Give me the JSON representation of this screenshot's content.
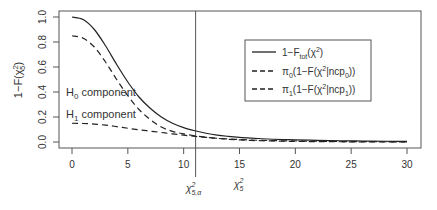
{
  "chart_data": {
    "type": "line",
    "title": "",
    "xlabel": "",
    "ylabel": "1-F(χ²₅)",
    "xlim": [
      0,
      30
    ],
    "ylim": [
      0,
      1.0
    ],
    "x_ticks": [
      0,
      5,
      10,
      15,
      20,
      25,
      30
    ],
    "y_ticks": [
      0.0,
      0.2,
      0.4,
      0.6,
      0.8,
      1.0
    ],
    "y_tick_labels": [
      "0.0",
      "0.2",
      "0.4",
      "0.6",
      "0.8",
      "1.0"
    ],
    "grid": false,
    "legend_position": "upper right",
    "x": [
      0,
      1,
      2,
      3,
      4,
      5,
      6,
      7,
      8,
      9,
      10,
      11,
      12,
      13,
      14,
      15,
      16,
      17,
      18,
      19,
      20,
      22,
      24,
      26,
      28,
      30
    ],
    "series": [
      {
        "name": "1−F_tot(χ²)",
        "style": "solid",
        "values": [
          1.0,
          0.98,
          0.9,
          0.77,
          0.62,
          0.48,
          0.36,
          0.27,
          0.2,
          0.15,
          0.115,
          0.09,
          0.07,
          0.055,
          0.045,
          0.037,
          0.031,
          0.026,
          0.022,
          0.019,
          0.017,
          0.013,
          0.01,
          0.008,
          0.006,
          0.005
        ]
      },
      {
        "name": "π₀(1−F(χ²|ncp₀))",
        "style": "dashed",
        "values": [
          0.85,
          0.83,
          0.76,
          0.64,
          0.5,
          0.37,
          0.26,
          0.18,
          0.12,
          0.085,
          0.065,
          0.05,
          0.038,
          0.029,
          0.022,
          0.017,
          0.013,
          0.01,
          0.008,
          0.006,
          0.005,
          0.003,
          0.002,
          0.001,
          0.001,
          0.0
        ]
      },
      {
        "name": "π₁(1−F(χ²|ncp₁))",
        "style": "dashed",
        "values": [
          0.15,
          0.148,
          0.143,
          0.135,
          0.123,
          0.11,
          0.098,
          0.087,
          0.076,
          0.065,
          0.055,
          0.045,
          0.037,
          0.03,
          0.024,
          0.02,
          0.016,
          0.013,
          0.011,
          0.009,
          0.008,
          0.006,
          0.004,
          0.003,
          0.002,
          0.001
        ]
      }
    ],
    "annotations": [
      {
        "text": "H₀ component",
        "x": 0,
        "y": 0.36
      },
      {
        "text": "H₁ component",
        "x": 0,
        "y": 0.2
      },
      {
        "type": "vline",
        "x": 11.07,
        "label": "χ²₅,α"
      },
      {
        "text": "χ²₅",
        "x": 15,
        "below_axis": true
      }
    ]
  },
  "labels": {
    "ylabel_main": "1−F(χ",
    "ylabel_sup": "2",
    "ylabel_sub": "5",
    "ylabel_end": ")",
    "h0_main": "H",
    "h0_sub": "0",
    "h0_rest": " component",
    "h1_main": "H",
    "h1_sub": "1",
    "h1_rest": " component",
    "crit_main": "χ",
    "crit_sup": "2",
    "crit_sub": "5,α",
    "stat_main": "χ",
    "stat_sup": "2",
    "stat_sub": "5"
  },
  "legend": {
    "items": [
      {
        "pre": "1−F",
        "sub": "tot",
        "mid": "(χ",
        "sup": "2",
        "post": ")"
      },
      {
        "pre": "π",
        "sub": "0",
        "mid": "(1−F(χ",
        "sup": "2",
        "mid2": "|ncp",
        "sub2": "0",
        "post": "))"
      },
      {
        "pre": "π",
        "sub": "1",
        "mid": "(1−F(χ",
        "sup": "2",
        "mid2": "|ncp",
        "sub2": "1",
        "post": "))"
      }
    ]
  }
}
